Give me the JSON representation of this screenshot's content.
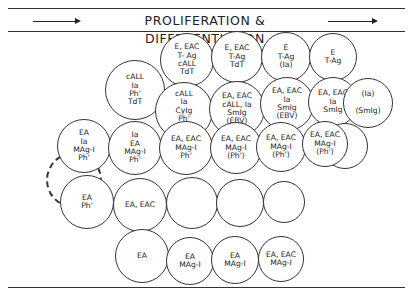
{
  "header": {
    "title": "PROLIFERATION & DIFFERENTIATION",
    "arrow_direction": "right"
  },
  "cells": [
    {
      "id": "r1c1",
      "x": 187,
      "y": 60,
      "r": 27,
      "lines": [
        "E, EAC",
        "T- Ag",
        "cALL",
        "TdT"
      ]
    },
    {
      "id": "r1c2",
      "x": 237,
      "y": 57,
      "r": 26,
      "lines": [
        "E, EAC",
        "T-Ag",
        "TdT"
      ]
    },
    {
      "id": "r1c3",
      "x": 286,
      "y": 57,
      "r": 25,
      "lines": [
        "E",
        "T-Ag",
        "(Ia)"
      ]
    },
    {
      "id": "r1c4",
      "x": 333,
      "y": 57,
      "r": 24,
      "lines": [
        "E",
        "T-Ag"
      ]
    },
    {
      "id": "r2c1",
      "x": 135,
      "y": 90,
      "r": 30,
      "lines": [
        "cALL",
        "Ia",
        "Ph'",
        "TdT"
      ]
    },
    {
      "id": "r2c2",
      "x": 184,
      "y": 111,
      "r": 29,
      "lines": [
        "cALL",
        "Ia",
        "CyIg",
        "Ph'",
        "TdT"
      ]
    },
    {
      "id": "r2c3",
      "x": 237,
      "y": 109,
      "r": 28,
      "lines": [
        "EA, EAC",
        "cALL, Ia",
        "SmIg",
        "(EBV)"
      ]
    },
    {
      "id": "r2c4",
      "x": 287,
      "y": 104,
      "r": 27,
      "lines": [
        "EA, EAC",
        "Ia",
        "SmIg",
        "(EBV)"
      ]
    },
    {
      "id": "r2c5",
      "x": 333,
      "y": 102,
      "r": 25,
      "lines": [
        "EA, EAC",
        "Ia",
        "SmIg"
      ]
    },
    {
      "id": "r2c6",
      "x": 368,
      "y": 103,
      "r": 25,
      "lines": [
        "(Ia)",
        "",
        "(SmIg)"
      ]
    },
    {
      "id": "r3c1",
      "x": 84,
      "y": 146,
      "r": 27,
      "lines": [
        "EA",
        "Ia",
        "MAg-I",
        "Ph'"
      ]
    },
    {
      "id": "r3c2",
      "x": 135,
      "y": 148,
      "r": 27,
      "lines": [
        "Ia",
        "EA",
        "MAg-I",
        "Ph'"
      ]
    },
    {
      "id": "r3c3",
      "x": 186,
      "y": 148,
      "r": 27,
      "lines": [
        "EA, EAC",
        "MAg-I",
        "Ph'"
      ]
    },
    {
      "id": "r3c4",
      "x": 236,
      "y": 148,
      "r": 26,
      "lines": [
        "EA, EAC",
        "MAg-I",
        "(Ph')"
      ]
    },
    {
      "id": "r3c5",
      "x": 281,
      "y": 147,
      "r": 25,
      "lines": [
        "EA, EAC",
        "MAg-I",
        "(Ph')"
      ]
    },
    {
      "id": "r3c6",
      "x": 345,
      "y": 146,
      "r": 23,
      "lines": []
    },
    {
      "id": "r3c7",
      "x": 325,
      "y": 144,
      "r": 23,
      "lines": [
        "EA, EAC",
        "MAg-I",
        "(Ph')"
      ]
    },
    {
      "id": "r4c1",
      "x": 87,
      "y": 202,
      "r": 27,
      "lines": [
        "EA",
        "Ph'"
      ]
    },
    {
      "id": "r4c2",
      "x": 140,
      "y": 205,
      "r": 27,
      "lines": [
        "EA, EAC"
      ]
    },
    {
      "id": "r4c3",
      "x": 192,
      "y": 203,
      "r": 26,
      "lines": []
    },
    {
      "id": "r4c4",
      "x": 240,
      "y": 203,
      "r": 24,
      "lines": []
    },
    {
      "id": "r4c5",
      "x": 284,
      "y": 202,
      "r": 21,
      "lines": []
    },
    {
      "id": "r5c1",
      "x": 142,
      "y": 256,
      "r": 27,
      "lines": [
        "EA"
      ]
    },
    {
      "id": "r5c2",
      "x": 190,
      "y": 261,
      "r": 24,
      "lines": [
        "EA",
        "MAg-I"
      ]
    },
    {
      "id": "r5c3",
      "x": 235,
      "y": 260,
      "r": 24,
      "lines": [
        "EA",
        "MAg-I"
      ]
    },
    {
      "id": "r5c4",
      "x": 281,
      "y": 259,
      "r": 23,
      "lines": [
        "EA, EAC",
        "MAg-I"
      ]
    }
  ],
  "stem_cell": {
    "x": 74,
    "y": 180,
    "r": 28,
    "style": "dashed"
  }
}
